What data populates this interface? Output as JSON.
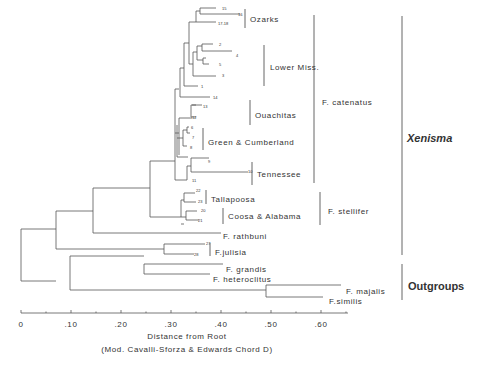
{
  "figure": {
    "type": "dendrogram",
    "axis": {
      "title": "Distance from Root",
      "subtitle": "(Mod. Cavalli-Sforza & Edwards Chord D)",
      "ticks": [
        "0",
        ".10",
        ".20",
        ".30",
        ".40",
        ".50",
        ".60"
      ]
    },
    "population_groups": [
      {
        "label": "Ozarks",
        "x": 250,
        "y": 19,
        "bar": [
          245,
          9,
          28
        ]
      },
      {
        "label": "Lower Miss.",
        "x": 270,
        "y": 67,
        "bar": [
          264,
          45,
          86
        ]
      },
      {
        "label": "Ouachitas",
        "x": 255,
        "y": 115,
        "bar": [
          250,
          100,
          125
        ]
      },
      {
        "label": "Green & Cumberland",
        "x": 208,
        "y": 142,
        "bar": [
          203,
          128,
          150
        ]
      },
      {
        "label": "Tennessee",
        "x": 257,
        "y": 174,
        "bar": [
          252,
          162,
          185
        ]
      },
      {
        "label": "Tallapoosa",
        "x": 211,
        "y": 199,
        "bar": [
          206,
          190,
          204
        ]
      },
      {
        "label": "Coosa & Alabama",
        "x": 228,
        "y": 216,
        "bar": [
          223,
          208,
          224
        ]
      }
    ],
    "species": [
      {
        "label": "F. catenatus",
        "x": 322,
        "y": 102,
        "bar": [
          314,
          15,
          183
        ]
      },
      {
        "label": "F. stellifer",
        "x": 328,
        "y": 211,
        "bar": [
          320,
          192,
          225
        ]
      },
      {
        "label": "F. rathbuni",
        "x": 223,
        "y": 236
      },
      {
        "label": "F.julisia",
        "x": 215,
        "y": 252,
        "bar": [
          210,
          243,
          256
        ]
      },
      {
        "label": "F. grandis",
        "x": 226,
        "y": 269
      },
      {
        "label": "F. heteroclitus",
        "x": 213,
        "y": 279
      },
      {
        "label": "F. majalis",
        "x": 346,
        "y": 291
      },
      {
        "label": "F.similis",
        "x": 329,
        "y": 301
      }
    ],
    "major_groups": [
      {
        "label": "Xenisma",
        "italic": true,
        "x": 407,
        "y": 139,
        "bar": [
          402,
          16,
          255
        ]
      },
      {
        "label": "Outgroups",
        "italic": false,
        "x": 408,
        "y": 287,
        "bar": [
          402,
          264,
          300
        ]
      }
    ],
    "terminal_numbers": [
      {
        "label": "15",
        "x": 222,
        "y": 10
      },
      {
        "label": "16",
        "x": 238,
        "y": 16
      },
      {
        "label": "17-18",
        "x": 218,
        "y": 25
      },
      {
        "label": "2",
        "x": 219,
        "y": 46
      },
      {
        "label": "4",
        "x": 236,
        "y": 57
      },
      {
        "label": "5",
        "x": 219,
        "y": 66
      },
      {
        "label": "3",
        "x": 222,
        "y": 77
      },
      {
        "label": "1",
        "x": 201,
        "y": 88
      },
      {
        "label": "14",
        "x": 213,
        "y": 99
      },
      {
        "label": "13",
        "x": 203,
        "y": 108
      },
      {
        "label": "12",
        "x": 192,
        "y": 119
      },
      {
        "label": "6",
        "x": 191,
        "y": 129
      },
      {
        "label": "7",
        "x": 192,
        "y": 139
      },
      {
        "label": "8",
        "x": 190,
        "y": 149
      },
      {
        "label": "9",
        "x": 208,
        "y": 163
      },
      {
        "label": "10",
        "x": 248,
        "y": 173
      },
      {
        "label": "11",
        "x": 192,
        "y": 182
      },
      {
        "label": "22",
        "x": 196,
        "y": 192
      },
      {
        "label": "23",
        "x": 198,
        "y": 203
      },
      {
        "label": "20",
        "x": 201,
        "y": 212
      },
      {
        "label": "21",
        "x": 198,
        "y": 222
      },
      {
        "label": "27",
        "x": 206,
        "y": 245
      },
      {
        "label": "28",
        "x": 194,
        "y": 256
      }
    ]
  },
  "chart_data": {
    "type": "dendrogram",
    "title": "",
    "xlabel": "Distance from Root (Mod. Cavalli-Sforza & Edwards Chord D)",
    "xlim": [
      0,
      0.65
    ],
    "x_ticks": [
      0,
      0.1,
      0.2,
      0.3,
      0.4,
      0.5,
      0.6
    ],
    "leaves_top_to_bottom": [
      "15",
      "16",
      "17-18",
      "2",
      "4",
      "5",
      "3",
      "1",
      "14",
      "13",
      "12",
      "6",
      "7",
      "8",
      "9",
      "10",
      "11",
      "22",
      "23",
      "20",
      "21",
      "F. rathbuni",
      "27",
      "28",
      "F. grandis",
      "F. heteroclitus",
      "F. majalis",
      "F.similis"
    ],
    "clades": {
      "F. catenatus": [
        "Ozarks",
        "Lower Miss.",
        "Ouachitas",
        "Green & Cumberland",
        "Tennessee"
      ],
      "F. stellifer": [
        "Tallapoosa",
        "Coosa & Alabama"
      ],
      "Xenisma": [
        "F. catenatus",
        "F. stellifer",
        "F. rathbuni",
        "F.julisia"
      ],
      "Outgroups": [
        "F. grandis",
        "F. heteroclitus",
        "F. majalis",
        "F.similis"
      ]
    },
    "approx_node_distances": {
      "root": 0.0,
      "Xenisma": 0.07,
      "Outgroups": 0.07,
      "catenatus+stellifer+rathbuni": 0.145,
      "catenatus+stellifer": 0.255,
      "F. catenatus": 0.305,
      "F. stellifer": 0.355,
      "F.julisia": 0.29,
      "grandis+heteroclitus": 0.245,
      "majalis+similis": 0.49
    },
    "approx_leaf_distances": {
      "F. rathbuni": 0.4,
      "F.julisia 27": 0.365,
      "F.julisia 28": 0.34,
      "F. grandis": 0.39,
      "F. heteroclitus": 0.385,
      "F. majalis": 0.645,
      "F.similis": 0.61
    }
  },
  "tree_segments": [
    [
      21,
      229,
      21,
      281
    ],
    [
      21,
      229,
      56,
      229
    ],
    [
      21,
      281,
      56,
      281
    ],
    [
      56,
      211,
      56,
      249
    ],
    [
      56,
      211,
      93,
      211
    ],
    [
      56,
      249,
      164,
      249
    ],
    [
      93,
      188,
      93,
      233
    ],
    [
      93,
      188,
      150,
      188
    ],
    [
      93,
      233,
      221,
      233
    ],
    [
      150,
      161,
      150,
      217
    ],
    [
      150,
      161,
      175,
      161
    ],
    [
      150,
      217,
      181,
      217
    ],
    [
      175,
      89,
      175,
      180
    ],
    [
      175,
      89,
      179,
      89
    ],
    [
      175,
      133,
      179,
      133
    ],
    [
      175,
      180,
      187,
      180
    ],
    [
      179,
      118,
      179,
      155
    ],
    [
      179,
      118,
      192,
      118
    ],
    [
      179,
      155,
      179,
      155
    ],
    [
      177,
      125,
      177,
      157
    ],
    [
      177,
      138,
      183,
      138
    ],
    [
      177,
      157,
      188,
      157
    ],
    [
      183,
      130,
      183,
      146
    ],
    [
      183,
      130,
      187,
      130
    ],
    [
      183,
      146,
      187,
      146
    ],
    [
      187,
      127,
      187,
      133
    ],
    [
      187,
      127,
      189,
      127
    ],
    [
      187,
      133,
      190,
      133
    ],
    [
      188,
      147,
      188,
      147
    ],
    [
      180,
      68,
      180,
      97
    ],
    [
      180,
      68,
      184,
      68
    ],
    [
      180,
      97,
      210,
      97
    ],
    [
      184,
      43,
      184,
      86
    ],
    [
      184,
      43,
      189,
      43
    ],
    [
      184,
      86,
      198,
      86
    ],
    [
      189,
      22,
      189,
      64
    ],
    [
      189,
      22,
      196,
      22
    ],
    [
      189,
      64,
      193,
      64
    ],
    [
      196,
      11,
      196,
      22
    ],
    [
      196,
      11,
      200,
      11
    ],
    [
      196,
      22,
      216,
      22
    ],
    [
      200,
      8,
      200,
      14
    ],
    [
      200,
      8,
      216,
      8
    ],
    [
      200,
      14,
      240,
      14
    ],
    [
      193,
      52,
      193,
      76
    ],
    [
      193,
      52,
      197,
      52
    ],
    [
      193,
      76,
      216,
      76
    ],
    [
      197,
      46,
      197,
      60
    ],
    [
      197,
      46,
      202,
      46
    ],
    [
      197,
      60,
      203,
      60
    ],
    [
      202,
      44,
      202,
      51
    ],
    [
      202,
      44,
      213,
      44
    ],
    [
      202,
      51,
      232,
      51
    ],
    [
      203,
      58,
      203,
      64
    ],
    [
      203,
      58,
      206,
      58
    ],
    [
      203,
      64,
      209,
      64
    ],
    [
      191,
      105,
      191,
      117
    ],
    [
      191,
      105,
      196,
      105
    ],
    [
      191,
      117,
      196,
      117
    ],
    [
      196,
      104,
      196,
      104
    ],
    [
      192,
      105,
      202,
      105
    ],
    [
      187,
      166,
      187,
      180
    ],
    [
      187,
      166,
      191,
      166
    ],
    [
      191,
      158,
      191,
      172
    ],
    [
      191,
      158,
      209,
      158
    ],
    [
      191,
      172,
      248,
      172
    ],
    [
      181,
      200,
      181,
      217
    ],
    [
      181,
      200,
      184,
      200
    ],
    [
      181,
      224,
      184,
      224
    ],
    [
      184,
      193,
      184,
      202
    ],
    [
      184,
      193,
      195,
      193
    ],
    [
      184,
      202,
      196,
      202
    ],
    [
      181,
      217,
      186,
      217
    ],
    [
      186,
      211,
      186,
      220
    ],
    [
      186,
      211,
      197,
      211
    ],
    [
      186,
      220,
      199,
      220
    ],
    [
      164,
      244,
      164,
      254
    ],
    [
      164,
      244,
      205,
      244
    ],
    [
      164,
      254,
      194,
      254
    ],
    [
      70,
      256,
      70,
      290
    ],
    [
      70,
      256,
      144,
      256
    ],
    [
      70,
      290,
      266,
      290
    ],
    [
      144,
      264,
      144,
      274
    ],
    [
      144,
      264,
      223,
      264
    ],
    [
      144,
      274,
      210,
      274
    ],
    [
      266,
      285,
      266,
      297
    ],
    [
      266,
      285,
      341,
      285
    ],
    [
      266,
      297,
      323,
      297
    ]
  ]
}
